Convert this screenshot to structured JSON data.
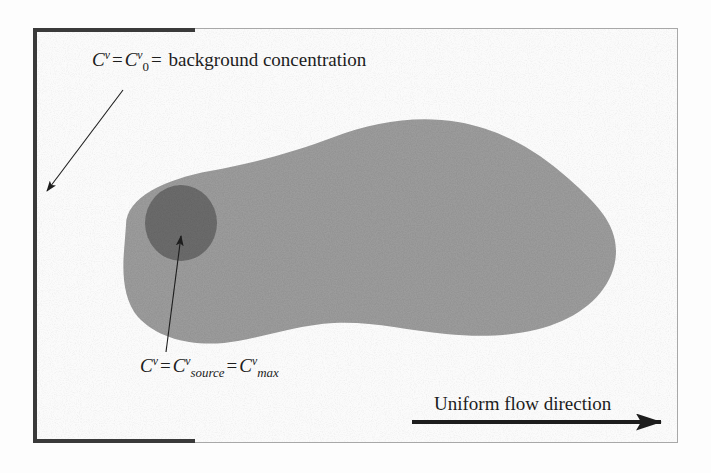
{
  "figure": {
    "caption_background": {
      "var": "C",
      "superscript": "v",
      "equals_1": "=",
      "var2": "C",
      "superscript2": "v",
      "subscript_zero": "0",
      "equals_2": "=",
      "text": "background concentration",
      "full_text": "Cᵛ = Cᵛ₀ = background concentration"
    },
    "caption_source": {
      "var": "C",
      "superscript": "v",
      "equals_1": "=",
      "var2": "C",
      "superscript2": "v",
      "subscript_source": "source",
      "equals_2": "=",
      "var3": "C",
      "superscript3": "v",
      "subscript_max": "max",
      "full_text": "Cᵛ = Cᵛₛₒᵤᵣᴄₑ = Cᵛₘₐₓ"
    },
    "flow_label": "Uniform flow direction",
    "colors": {
      "plume_fill": "#a0a0a0",
      "source_fill": "#6e6e6e",
      "frame_border": "#a8a8a8",
      "rule_dark": "#3a3a3a",
      "background": "#fbfbfb",
      "text": "#1d1d1d",
      "stipple": "#c9c9c9"
    }
  },
  "bleed_text": {
    "top": "",
    "left_1": "",
    "left_2": "",
    "bottom": "",
    "right": ""
  }
}
